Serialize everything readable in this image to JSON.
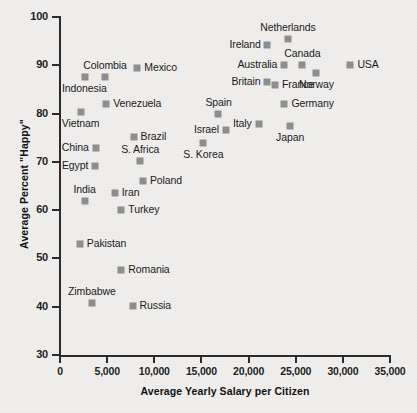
{
  "chart_data": {
    "type": "scatter",
    "title": "",
    "xlabel": "Average Yearly Salary per Citizen",
    "ylabel": "Average Percent \"Happy\"",
    "xlim": [
      0,
      35000
    ],
    "ylim": [
      30,
      100
    ],
    "grid": false,
    "legend": null,
    "xticks": [
      "0",
      "5,000",
      "10,000",
      "15,000",
      "20,000",
      "25,000",
      "30,000",
      "35,000"
    ],
    "xtick_values": [
      0,
      5000,
      10000,
      15000,
      20000,
      25000,
      30000,
      35000
    ],
    "yticks": [
      "30",
      "40",
      "50",
      "60",
      "70",
      "80",
      "90",
      "100"
    ],
    "ytick_values": [
      30,
      40,
      50,
      60,
      70,
      80,
      90,
      100
    ],
    "marker_color": "#8e8e8e",
    "points": [
      {
        "label": "Netherlands",
        "x": 24200,
        "y": 95.5,
        "label_pos": "above"
      },
      {
        "label": "Ireland",
        "x": 22000,
        "y": 94.2,
        "label_pos": "left"
      },
      {
        "label": "Canada",
        "x": 25700,
        "y": 90.0,
        "label_pos": "above"
      },
      {
        "label": "Australia",
        "x": 23800,
        "y": 90.0,
        "label_pos": "left"
      },
      {
        "label": "USA",
        "x": 30800,
        "y": 90.0,
        "label_pos": "right"
      },
      {
        "label": "Norway",
        "x": 27200,
        "y": 88.4,
        "label_pos": "below"
      },
      {
        "label": "Britain",
        "x": 22000,
        "y": 86.5,
        "label_pos": "left"
      },
      {
        "label": "France",
        "x": 22800,
        "y": 85.9,
        "label_pos": "right"
      },
      {
        "label": "Germany",
        "x": 23800,
        "y": 82.0,
        "label_pos": "right"
      },
      {
        "label": "Japan",
        "x": 24400,
        "y": 77.5,
        "label_pos": "below"
      },
      {
        "label": "Italy",
        "x": 21100,
        "y": 77.9,
        "label_pos": "left"
      },
      {
        "label": "Spain",
        "x": 16800,
        "y": 80.0,
        "label_pos": "above"
      },
      {
        "label": "Israel",
        "x": 17600,
        "y": 76.6,
        "label_pos": "left"
      },
      {
        "label": "S. Korea",
        "x": 15200,
        "y": 74.0,
        "label_pos": "below"
      },
      {
        "label": "Mexico",
        "x": 8200,
        "y": 89.5,
        "label_pos": "right"
      },
      {
        "label": "Colombia",
        "x": 4800,
        "y": 87.5,
        "label_pos": "above"
      },
      {
        "label": "Indonesia",
        "x": 2600,
        "y": 87.5,
        "label_pos": "below"
      },
      {
        "label": "Venezuela",
        "x": 4900,
        "y": 82.0,
        "label_pos": "right"
      },
      {
        "label": "Vietnam",
        "x": 2200,
        "y": 80.3,
        "label_pos": "below"
      },
      {
        "label": "Brazil",
        "x": 7800,
        "y": 75.2,
        "label_pos": "right"
      },
      {
        "label": "China",
        "x": 3800,
        "y": 72.9,
        "label_pos": "left"
      },
      {
        "label": "S. Africa",
        "x": 8500,
        "y": 70.2,
        "label_pos": "above"
      },
      {
        "label": "Egypt",
        "x": 3700,
        "y": 69.2,
        "label_pos": "left"
      },
      {
        "label": "Poland",
        "x": 8800,
        "y": 66.0,
        "label_pos": "right"
      },
      {
        "label": "Iran",
        "x": 5800,
        "y": 63.5,
        "label_pos": "right"
      },
      {
        "label": "India",
        "x": 2600,
        "y": 61.9,
        "label_pos": "above"
      },
      {
        "label": "Turkey",
        "x": 6500,
        "y": 60.0,
        "label_pos": "right"
      },
      {
        "label": "Pakistan",
        "x": 2100,
        "y": 53.0,
        "label_pos": "right"
      },
      {
        "label": "Romania",
        "x": 6500,
        "y": 47.7,
        "label_pos": "right"
      },
      {
        "label": "Russia",
        "x": 7700,
        "y": 40.2,
        "label_pos": "right"
      },
      {
        "label": "Zimbabwe",
        "x": 3400,
        "y": 40.8,
        "label_pos": "above"
      }
    ]
  }
}
